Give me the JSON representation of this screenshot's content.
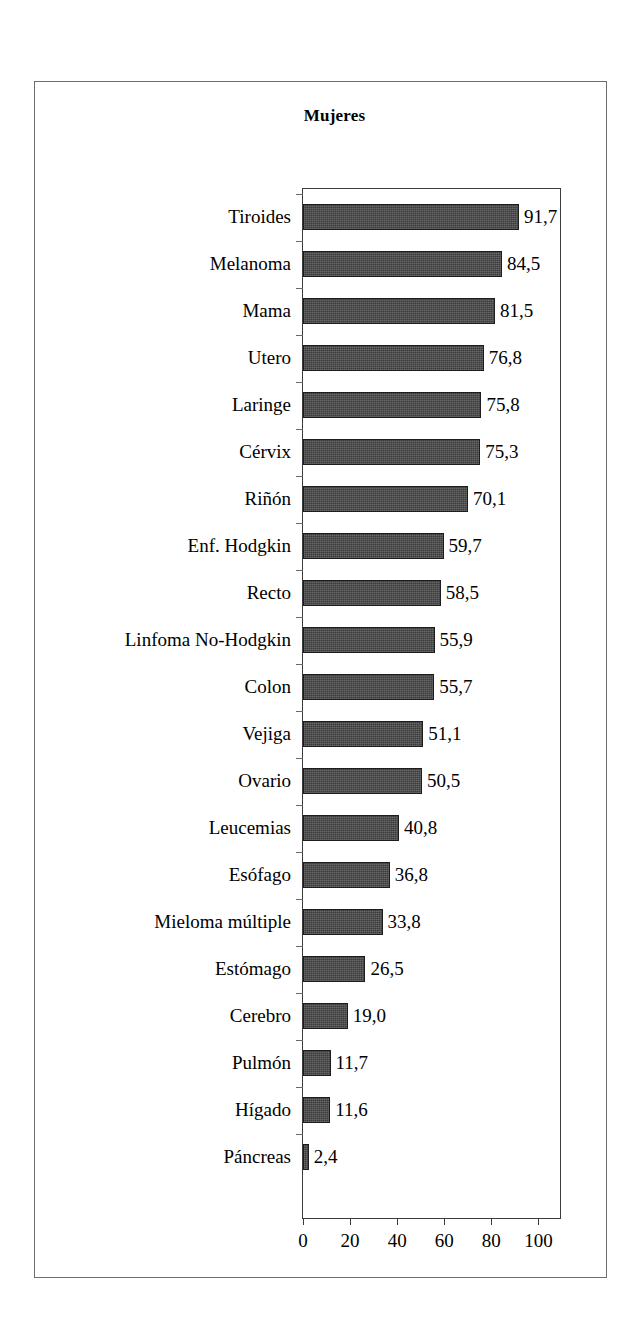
{
  "figure": {
    "title": "Mujeres"
  },
  "chart_data": {
    "type": "bar",
    "orientation": "horizontal",
    "title": "Mujeres",
    "xlabel": "",
    "ylabel": "",
    "xlim": [
      0,
      110
    ],
    "grid": false,
    "legend": null,
    "xticks": [
      "0",
      "20",
      "40",
      "60",
      "80",
      "100"
    ],
    "xtick_values": [
      0,
      20,
      40,
      60,
      80,
      100
    ],
    "bar_color": "#3b3b3b",
    "categories": [
      "Tiroides",
      "Melanoma",
      "Mama",
      "Utero",
      "Laringe",
      "Cérvix",
      "Riñón",
      "Enf. Hodgkin",
      "Recto",
      "Linfoma No-Hodgkin",
      "Colon",
      "Vejiga",
      "Ovario",
      "Leucemias",
      "Esófago",
      "Mieloma múltiple",
      "Estómago",
      "Cerebro",
      "Pulmón",
      "Hígado",
      "Páncreas"
    ],
    "values": [
      91.7,
      84.5,
      81.5,
      76.8,
      75.8,
      75.3,
      70.1,
      59.7,
      58.5,
      55.9,
      55.7,
      51.1,
      50.5,
      40.8,
      36.8,
      33.8,
      26.5,
      19.0,
      11.7,
      11.6,
      2.4
    ],
    "value_labels": [
      "91,7",
      "84,5",
      "81,5",
      "76,8",
      "75,8",
      "75,3",
      "70,1",
      "59,7",
      "58,5",
      "55,9",
      "55,7",
      "51,1",
      "50,5",
      "40,8",
      "36,8",
      "33,8",
      "26,5",
      "19,0",
      "11,7",
      "11,6",
      "2,4"
    ]
  }
}
